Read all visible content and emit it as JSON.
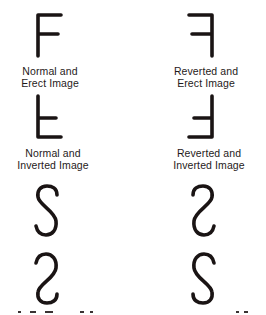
{
  "figure": {
    "panels": [
      {
        "id": "normal-erect",
        "glyph": "F",
        "transform": "none",
        "caption": "Normal and\nErect Image"
      },
      {
        "id": "reverted-erect",
        "glyph": "F",
        "transform": "mirror-horizontal",
        "caption": "Reverted and\nErect Image"
      },
      {
        "id": "normal-inverted",
        "glyph": "F",
        "transform": "flip-vertical",
        "caption": "Normal and\nInverted Image"
      },
      {
        "id": "reverted-inverted",
        "glyph": "F",
        "transform": "rotate-180",
        "caption": "Reverted and\nInverted Image"
      },
      {
        "id": "s-normal-erect",
        "glyph": "S",
        "transform": "none",
        "caption": ""
      },
      {
        "id": "s-reverted-erect",
        "glyph": "S",
        "transform": "mirror-horizontal",
        "caption": ""
      },
      {
        "id": "s-normal-inverted",
        "glyph": "S",
        "transform": "flip-vertical",
        "caption": ""
      },
      {
        "id": "s-reverted-inverted",
        "glyph": "S",
        "transform": "rotate-180",
        "caption": ""
      }
    ],
    "stroke_color": "#1a1414"
  }
}
